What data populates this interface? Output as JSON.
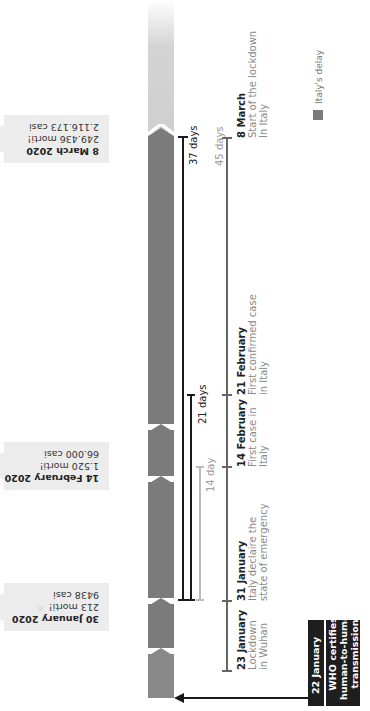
{
  "colors": {
    "bar_dark": "#7b7b7b",
    "bar_light": "#cfcfcf",
    "callout_bg": "#ececec",
    "who_bg": "#1e1e1e",
    "bracket_black": "#1a1a1a",
    "bracket_gray": "#bbbbbb",
    "line_45": "#666666"
  },
  "callouts": [
    {
      "date": "8 March 2020",
      "deaths": "249.436 morti!",
      "cases": "2.116.173 casi"
    },
    {
      "date": "14 February 2020",
      "deaths": "1.520 morti!",
      "cases": "66.000 casi"
    },
    {
      "date": "30 January 2020",
      "deaths": "213 morti!",
      "cases": "9438 casi"
    }
  ],
  "brackets": [
    {
      "label": "37 days"
    },
    {
      "label": "21 days"
    },
    {
      "label": "14 day"
    },
    {
      "label": "45 days"
    }
  ],
  "events": [
    {
      "date": "8 March",
      "desc1": "Start of the lockdown",
      "desc2": "In Italy"
    },
    {
      "date": "21 February",
      "desc1": "First confirmed case",
      "desc2": "in Italy"
    },
    {
      "date": "14 February",
      "desc1": "First case in",
      "desc2": "Italy"
    },
    {
      "date": "31 January",
      "desc1": "Italy declaire the",
      "desc2": "state of emergency"
    },
    {
      "date": "23 January",
      "desc1": "Lockdown",
      "desc2": "in Wuhan"
    }
  ],
  "who": {
    "date": "22 January",
    "line1": "WHO certifies",
    "line2": "human-to-human",
    "line3": "transmission"
  },
  "legend": {
    "label": "Italy's delay"
  }
}
